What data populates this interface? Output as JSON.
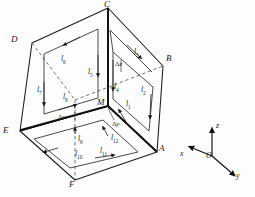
{
  "figure": {
    "stroke_color": "#1a1a1a",
    "dashed_color": "#555555",
    "background": "#fdfdfd"
  },
  "vertices": [
    {
      "id": "C",
      "label": "C",
      "x": 108,
      "y": 8,
      "lx": 105,
      "ly": 1
    },
    {
      "id": "D",
      "label": "D",
      "x": 32,
      "y": 43,
      "lx": 12,
      "ly": 36
    },
    {
      "id": "B",
      "label": "B",
      "x": 163,
      "y": 66,
      "lx": 166,
      "ly": 56
    },
    {
      "id": "E",
      "label": "E",
      "x": 20,
      "y": 131,
      "lx": 5,
      "ly": 127
    },
    {
      "id": "A",
      "label": "A",
      "x": 157,
      "y": 152,
      "lx": 160,
      "ly": 146
    },
    {
      "id": "F",
      "label": "F",
      "x": 75,
      "y": 180,
      "lx": 70,
      "ly": 180
    },
    {
      "id": "M",
      "label": "M",
      "x": 108,
      "y": 106,
      "lx": 97,
      "ly": 100
    }
  ],
  "segments": [
    {
      "id": "l1",
      "label": "l",
      "sub": "1",
      "face": "right",
      "lx": 126,
      "ly": 102,
      "direction": "up"
    },
    {
      "id": "l2",
      "label": "l",
      "sub": "2",
      "face": "right",
      "lx": 141,
      "ly": 88,
      "direction": "down"
    },
    {
      "id": "l3",
      "label": "l",
      "sub": "3",
      "face": "right",
      "lx": 134,
      "ly": 50,
      "direction": "down-right"
    },
    {
      "id": "l4",
      "label": "l",
      "sub": "4",
      "face": "right",
      "lx": 113,
      "ly": 85,
      "direction": "down"
    },
    {
      "id": "l5",
      "label": "l",
      "sub": "5",
      "face": "back",
      "lx": 89,
      "ly": 70,
      "direction": "down"
    },
    {
      "id": "l6",
      "label": "l",
      "sub": "6",
      "face": "back",
      "lx": 62,
      "ly": 57,
      "direction": "right"
    },
    {
      "id": "l7",
      "label": "l",
      "sub": "7",
      "face": "back",
      "lx": 38,
      "ly": 88,
      "direction": "down"
    },
    {
      "id": "l8",
      "label": "l",
      "sub": "8",
      "face": "back",
      "lx": 64,
      "ly": 95,
      "direction": "right"
    },
    {
      "id": "l9",
      "label": "l",
      "sub": "9",
      "face": "bottom",
      "lx": 78,
      "ly": 137,
      "direction": "up"
    },
    {
      "id": "l10",
      "label": "l",
      "sub": "10",
      "face": "bottom",
      "lx": 76,
      "ly": 152,
      "direction": "left"
    },
    {
      "id": "l11",
      "label": "l",
      "sub": "11",
      "face": "bottom",
      "lx": 101,
      "ly": 149,
      "direction": "right"
    },
    {
      "id": "l12",
      "label": "l",
      "sub": "12",
      "face": "bottom",
      "lx": 112,
      "ly": 136,
      "direction": "up"
    }
  ],
  "dimensions": [
    {
      "id": "dx",
      "greek": "Δ",
      "var": "x",
      "lx": 60,
      "ly": 117
    },
    {
      "id": "dy",
      "greek": "Δ",
      "var": "y",
      "lx": 114,
      "ly": 124
    },
    {
      "id": "dz",
      "greek": "Δ",
      "var": "z",
      "lx": 117,
      "ly": 64
    }
  ],
  "axes": {
    "origin": {
      "label": "O",
      "x": 212,
      "y": 156,
      "lx": 208,
      "ly": 153
    },
    "arrows": [
      {
        "id": "z",
        "label": "z",
        "x2": 212,
        "y2": 127,
        "lx": 216,
        "ly": 124
      },
      {
        "id": "x",
        "label": "x",
        "x2": 188,
        "y2": 146,
        "lx": 181,
        "ly": 153
      },
      {
        "id": "y",
        "label": "y",
        "x2": 236,
        "y2": 176,
        "lx": 238,
        "ly": 174
      }
    ]
  }
}
